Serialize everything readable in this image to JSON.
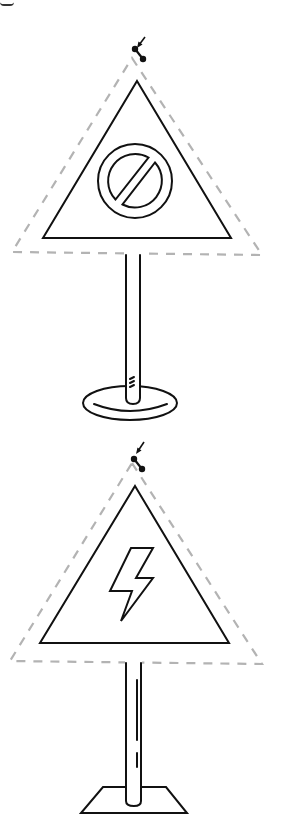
{
  "canvas": {
    "width": 281,
    "height": 819,
    "background": "#ffffff",
    "stroke_color": "#111111",
    "selection_color": "#b3b3b3"
  },
  "objects": [
    {
      "name": "prohibition-warning-sign",
      "symbol": "no-entry-circle",
      "support": "round-base-pole",
      "selected": true
    },
    {
      "name": "high-voltage-warning-sign",
      "symbol": "lightning-bolt",
      "support": "trapezoid-base-pole",
      "selected": true
    }
  ]
}
